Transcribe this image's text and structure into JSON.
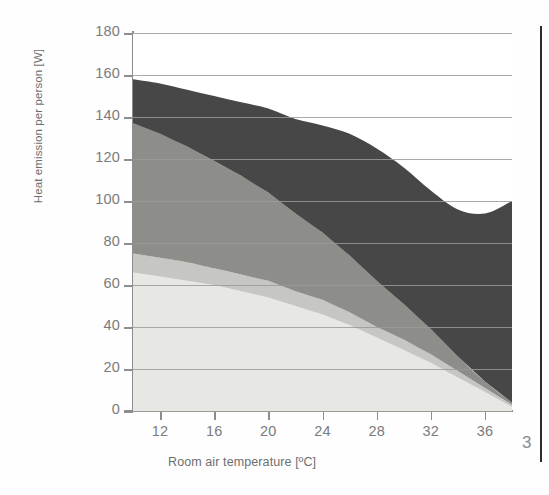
{
  "page": {
    "number": "3",
    "background": "#fefefe"
  },
  "chart_data": {
    "type": "area",
    "stacked": true,
    "title": "",
    "xlabel": "Room air temperature [ºC]",
    "ylabel": "Heat emission per person [W]",
    "xlim": [
      10,
      38
    ],
    "ylim": [
      0,
      180
    ],
    "xticks": [
      12,
      16,
      20,
      24,
      28,
      32,
      36
    ],
    "yticks": [
      0,
      20,
      40,
      60,
      80,
      100,
      120,
      140,
      160,
      180
    ],
    "grid": "horizontal",
    "legend_position": "inline-labels",
    "x": [
      10,
      12,
      14,
      16,
      18,
      20,
      22,
      24,
      26,
      28,
      30,
      32,
      34,
      36,
      38
    ],
    "series": [
      {
        "name": "Heat radiation",
        "color": "#e7e7e4",
        "label_color": "#6e6e6e",
        "values": [
          66,
          64,
          62,
          60,
          57,
          54,
          50,
          46,
          41,
          35,
          29,
          23,
          16,
          9,
          2
        ]
      },
      {
        "name": "Heat conduction",
        "color": "#c6c6c2",
        "label_color": "#5a5a5a",
        "values": [
          9,
          9,
          9,
          8,
          8,
          8,
          7,
          7,
          6,
          5,
          5,
          4,
          3,
          2,
          1
        ]
      },
      {
        "name": "Convection",
        "color": "#8d8d8a",
        "label_color": "#5e5e5e",
        "values": [
          62,
          59,
          55,
          51,
          47,
          42,
          37,
          32,
          27,
          22,
          17,
          12,
          7,
          3,
          1
        ]
      },
      {
        "name": "Evaporation",
        "color": "#474747",
        "label_color": "#222222",
        "values": [
          21,
          24,
          27,
          31,
          35,
          40,
          45,
          51,
          58,
          63,
          65,
          66,
          70,
          80,
          96
        ]
      }
    ],
    "stack_totals": [
      158,
      156,
      153,
      150,
      147,
      144,
      139,
      136,
      132,
      125,
      116,
      105,
      96,
      94,
      100
    ],
    "axis_color": "#8d8d8d",
    "grid_color": "#9a9a9a",
    "tick_label_color": "#7b7b7b"
  }
}
